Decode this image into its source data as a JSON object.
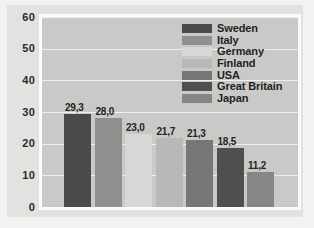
{
  "chart_data": {
    "type": "bar",
    "title": "",
    "subtitle": "",
    "xlabel": "",
    "ylabel": "",
    "categories": [
      "Sweden",
      "Italy",
      "Germany",
      "Finland",
      "USA",
      "Great Britain",
      "Japan"
    ],
    "values": [
      29.3,
      28.0,
      23.0,
      21.7,
      21.3,
      18.5,
      11.2
    ],
    "value_labels": [
      "29,3",
      "28,0",
      "23,0",
      "21,7",
      "21,3",
      "18,5",
      "11,2"
    ],
    "bar_colors": [
      "#4a4a4a",
      "#8f8f8d",
      "#d7d7d5",
      "#b8b8b6",
      "#777775",
      "#4f4f4f",
      "#868684"
    ],
    "ylim": [
      0,
      60
    ],
    "yticks": [
      0,
      10,
      20,
      30,
      40,
      50,
      60
    ],
    "ytick_labels": [
      "0",
      "10",
      "20",
      "30",
      "40",
      "50",
      "60"
    ],
    "grid": true,
    "grid_color": "#efefee",
    "legend_position": "top-right",
    "plot_background": "#c9c9c7",
    "figure_background": "#e2e2e0",
    "frame_color": "#fbfbfa"
  },
  "legend": {
    "items": [
      {
        "label": "Sweden",
        "color": "#4a4a4a"
      },
      {
        "label": "Italy",
        "color": "#8f8f8d"
      },
      {
        "label": "Germany",
        "color": "#d7d7d5"
      },
      {
        "label": "Finland",
        "color": "#b8b8b6"
      },
      {
        "label": "USA",
        "color": "#777775"
      },
      {
        "label": "Great Britain",
        "color": "#4f4f4f"
      },
      {
        "label": "Japan",
        "color": "#868684"
      }
    ]
  }
}
